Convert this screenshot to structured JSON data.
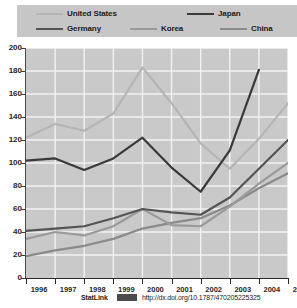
{
  "title_partial": "",
  "legend": {
    "items": [
      {
        "label": "United States",
        "color": "#b5b5b5",
        "key": "united_states"
      },
      {
        "label": "Japan",
        "color": "#3a3a3a",
        "key": "japan"
      },
      {
        "label": "Germany",
        "color": "#545454",
        "key": "germany"
      },
      {
        "label": "Korea",
        "color": "#9a9a9a",
        "key": "korea"
      },
      {
        "label": "China",
        "color": "#8a8a8a",
        "key": "china"
      }
    ]
  },
  "footer": {
    "statlink_label": "StatLink",
    "badge_icon": "statlink-badge-icon",
    "url": "http://dx.doi.org/10.1787/470205225325"
  },
  "colors": {
    "page_background": "#ffffff",
    "legend_background": "#c6c6c6",
    "plot_background": "#c9c9c9",
    "gridline": "#f2f2f2",
    "axis": "#2a2a2a",
    "text": "#1f1f1f"
  },
  "chart_data": {
    "type": "line",
    "title": "",
    "xlabel": "",
    "ylabel": "",
    "x": [
      1996,
      1997,
      1998,
      1999,
      2000,
      2001,
      2002,
      2003,
      2004,
      2005
    ],
    "xtick_labels": [
      "1996",
      "1997",
      "1998",
      "1999",
      "2000",
      "2001",
      "2002",
      "2003",
      "2004",
      "2005"
    ],
    "ylim": [
      0,
      200
    ],
    "yticks": [
      0,
      20,
      40,
      60,
      80,
      100,
      120,
      140,
      160,
      180,
      200
    ],
    "ytick_labels": [
      "0",
      "20",
      "40",
      "60",
      "80",
      "100",
      "120",
      "140",
      "160",
      "180",
      "200"
    ],
    "grid": true,
    "legend_position": "top",
    "series": [
      {
        "name": "United States",
        "color": "#b5b5b5",
        "width": 2.2,
        "values": [
          122,
          134,
          128,
          143,
          183,
          152,
          117,
          95,
          121,
          152
        ]
      },
      {
        "name": "Japan",
        "color": "#3a3a3a",
        "width": 2.2,
        "values": [
          102,
          104,
          94,
          104,
          122,
          96,
          75,
          111,
          181,
          null
        ]
      },
      {
        "name": "Germany",
        "color": "#545454",
        "width": 2.2,
        "values": [
          41,
          43,
          45,
          52,
          60,
          57,
          55,
          70,
          95,
          120
        ]
      },
      {
        "name": "Korea",
        "color": "#9a9a9a",
        "width": 2.2,
        "values": [
          34,
          40,
          37,
          45,
          60,
          46,
          45,
          62,
          82,
          100
        ]
      },
      {
        "name": "China",
        "color": "#8a8a8a",
        "width": 2.2,
        "values": [
          19,
          24,
          28,
          34,
          43,
          48,
          52,
          63,
          78,
          91
        ]
      }
    ]
  }
}
